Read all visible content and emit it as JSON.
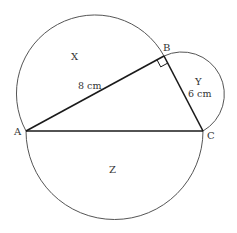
{
  "diagram": {
    "type": "right-triangle-with-semicircles",
    "colors": {
      "background": "#ffffff",
      "triangle_stroke": "#1a1a1a",
      "arc_stroke": "#555555",
      "label": "#333333"
    },
    "vertices": {
      "A": {
        "label": "A",
        "x": 26,
        "y": 131
      },
      "B": {
        "label": "B",
        "x": 164,
        "y": 56
      },
      "C": {
        "label": "C",
        "x": 203,
        "y": 131
      }
    },
    "sides": {
      "AB": {
        "length_label": "8 cm"
      },
      "BC": {
        "length_label": "6 cm"
      }
    },
    "regions": {
      "X": {
        "label": "X",
        "on_side": "AB"
      },
      "Y": {
        "label": "Y",
        "on_side": "BC"
      },
      "Z": {
        "label": "Z",
        "on_side": "AC"
      }
    },
    "right_angle_at": "B"
  }
}
